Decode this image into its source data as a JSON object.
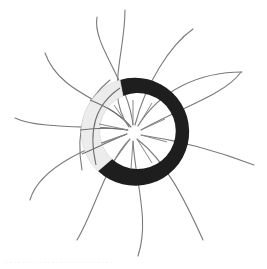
{
  "figure": {
    "center": [
      133,
      133
    ],
    "ring": {
      "outer_radius": 54,
      "inner_radius": 38,
      "dark_color": "#1e1e1e",
      "light_color": "#ececec",
      "light_segment_deg": [
        200,
        255
      ]
    },
    "arm_color": "#777777",
    "arm_count": 12
  },
  "caption": {
    "text": ". . .  . .  . .  . . . . . .  . . .  . .  . . . .  . . . ."
  }
}
